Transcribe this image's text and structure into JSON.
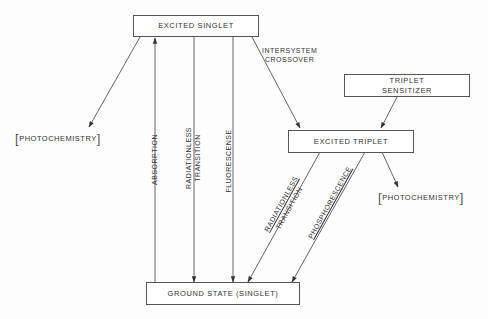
{
  "diagram": {
    "type": "energy-state-transition-diagram",
    "nodes": {
      "excited_singlet": "EXCITED SINGLET",
      "triplet_sensitizer_line1": "TRIPLET",
      "triplet_sensitizer_line2": "SENSITIZER",
      "excited_triplet": "EXCITED TRIPLET",
      "ground_state": "GROUND STATE (SINGLET)",
      "photochemistry_left": "PHOTOCHEMISTRY",
      "photochemistry_right": "PHOTOCHEMISTRY"
    },
    "edges": {
      "intersystem_line1": "INTERSYSTEM",
      "intersystem_line2": "CROSSOVER",
      "absorption": "ABSORPTION",
      "radiationless_singlet_line1": "RADIATIONLESS",
      "radiationless_singlet_line2": "TRANSITION",
      "fluorescence": "FLUORESCENSE",
      "radiationless_triplet_line1": "RADIATIONLESS",
      "radiationless_triplet_line2": "TRANSITION",
      "phosphorescence": "PHOSPHORESCENCE"
    },
    "bracket_open": "[",
    "bracket_close": "]",
    "colors": {
      "line": "#444444",
      "text": "#333333",
      "background": "#fdfdfd"
    }
  }
}
